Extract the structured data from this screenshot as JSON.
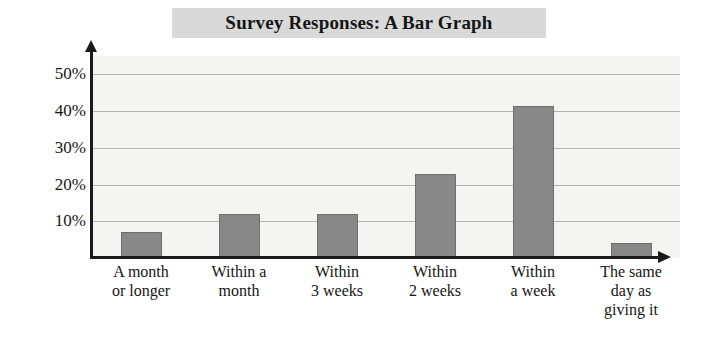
{
  "chart_data": {
    "type": "bar",
    "title": "Survey Responses: A Bar Graph",
    "xlabel": "",
    "ylabel": "",
    "categories": [
      "A month or longer",
      "Within a month",
      "Within 3 weeks",
      "Within 2 weeks",
      "Within a week",
      "The same day as giving it"
    ],
    "category_lines": [
      [
        "A month",
        "or longer"
      ],
      [
        "Within a",
        "month"
      ],
      [
        "Within",
        "3 weeks"
      ],
      [
        "Within",
        "2 weeks"
      ],
      [
        "Within",
        "a week"
      ],
      [
        "The same",
        "day as",
        "giving it"
      ]
    ],
    "values": [
      7,
      12,
      12,
      23,
      41.5,
      4
    ],
    "ylim": [
      0,
      55
    ],
    "yticks": [
      10,
      20,
      30,
      40,
      50
    ],
    "ytick_labels": [
      "10%",
      "20%",
      "30%",
      "40%",
      "50%"
    ],
    "grid": true,
    "legend": false,
    "bar_color": "#888888",
    "bar_border_color": "#6f6f6f",
    "plot_background": "#f4f4f2",
    "gridline_color": "#b3b3b3",
    "axis_color": "#1a1a1a",
    "title_band_color": "#d9d9d9"
  }
}
